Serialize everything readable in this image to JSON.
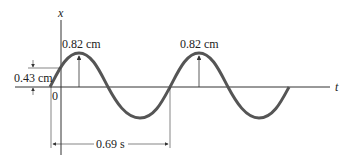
{
  "diagram": {
    "axis_labels": {
      "vertical": "x",
      "horizontal": "t"
    },
    "origin_label": "0",
    "peak_label_1": "0.82 cm",
    "peak_label_2": "0.82 cm",
    "initial_offset_label": "0.43 cm",
    "period_label": "0.69 s",
    "colors": {
      "wave": "#555555",
      "lines": "#333333"
    }
  }
}
